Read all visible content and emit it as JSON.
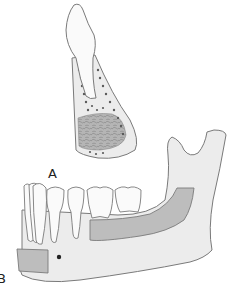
{
  "figure": {
    "type": "anatomical-illustration",
    "parts": [
      {
        "id": "maxillary-tooth",
        "description": "Single upper tooth with root embedded in alveolar bone"
      },
      {
        "id": "alveolar-bone-segment",
        "description": "Bone segment with trabecular pattern and shaded graft region"
      },
      {
        "id": "mandible",
        "description": "Lower jaw with teeth, ramus and condyle"
      },
      {
        "id": "graft-region-posterior",
        "description": "Shaded rectangular region along mandibular body"
      },
      {
        "id": "graft-region-anterior",
        "description": "Shaded rectangular region at symphysis"
      },
      {
        "id": "mental-foramen",
        "description": "Small dark dot on mandible"
      }
    ],
    "labels": {
      "a": "A",
      "b": "B"
    },
    "colors": {
      "outline": "#7a7a7a",
      "bone_fill": "#ececec",
      "tooth_fill": "#fafafa",
      "graft_fill": "#bdbdbd",
      "trabecular": "#555555",
      "foramen": "#222222"
    }
  }
}
